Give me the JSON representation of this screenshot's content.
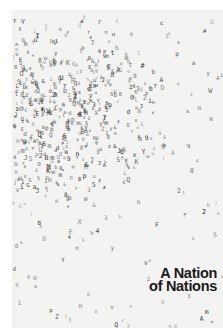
{
  "cover": {
    "title_line_1": "A Nation",
    "title_line_2": "of Nations",
    "background_color": "#f3f3f1",
    "ink_color": "#222222",
    "texture": "dense cloud of tiny type glyphs, darkest at upper-left center, scattering toward right and bottom"
  }
}
